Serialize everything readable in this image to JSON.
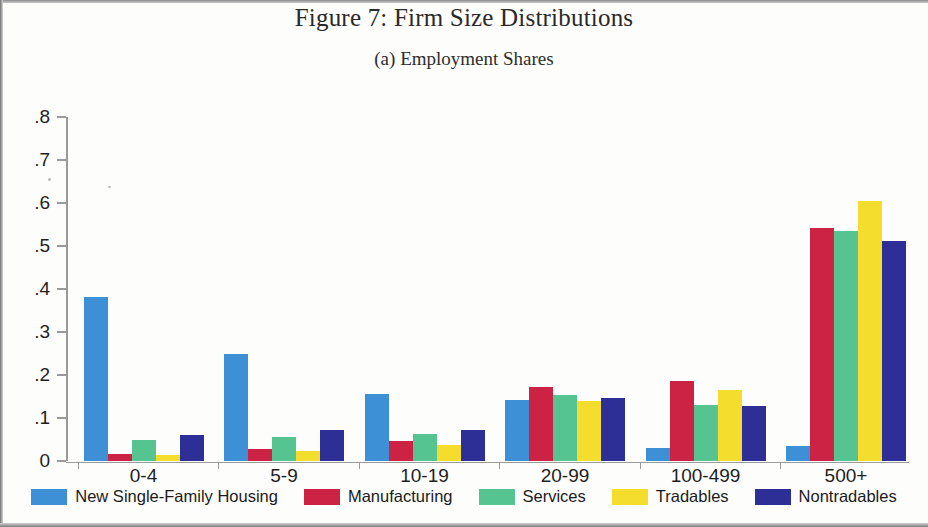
{
  "figure": {
    "title": "Figure 7: Firm Size Distributions",
    "subtitle": "(a) Employment Shares"
  },
  "chart_data": {
    "type": "bar",
    "title": "Figure 7: Firm Size Distributions",
    "subtitle": "(a) Employment Shares",
    "xlabel": "",
    "ylabel": "",
    "ylim": [
      0,
      0.8
    ],
    "grid": false,
    "legend_position": "bottom",
    "y_tick_labels": [
      "0",
      ".1",
      ".2",
      ".3",
      ".4",
      ".5",
      ".6",
      ".7",
      ".8"
    ],
    "y_tick_values": [
      0,
      0.1,
      0.2,
      0.3,
      0.4,
      0.5,
      0.6,
      0.7,
      0.8
    ],
    "categories": [
      "0-4",
      "5-9",
      "10-19",
      "20-99",
      "100-499",
      "500+"
    ],
    "series": [
      {
        "name": "New Single-Family Housing",
        "color": "#3d8fd6",
        "values": [
          0.381,
          0.248,
          0.156,
          0.143,
          0.03,
          0.034
        ]
      },
      {
        "name": "Manufacturing",
        "color": "#cc2244",
        "values": [
          0.016,
          0.028,
          0.046,
          0.171,
          0.185,
          0.543
        ]
      },
      {
        "name": "Services",
        "color": "#55c490",
        "values": [
          0.05,
          0.055,
          0.063,
          0.154,
          0.13,
          0.536
        ]
      },
      {
        "name": "Tradables",
        "color": "#f5dd2e",
        "values": [
          0.014,
          0.024,
          0.038,
          0.14,
          0.166,
          0.605
        ]
      },
      {
        "name": "Nontradables",
        "color": "#2e2f96",
        "values": [
          0.06,
          0.071,
          0.072,
          0.146,
          0.128,
          0.511
        ]
      }
    ]
  }
}
